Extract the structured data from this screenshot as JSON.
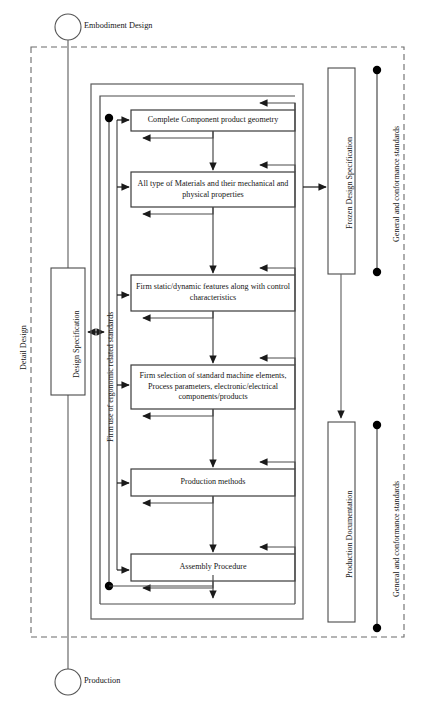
{
  "diagram": {
    "type": "flowchart",
    "phase_start_label": "Embodiment Design",
    "phase_end_label": "Production",
    "swimlane_label": "Detail Design",
    "colors": {
      "stroke": "#4a4a4a",
      "box_stroke": "#3a3a3a",
      "text": "#151515",
      "dashed_stroke": "#6b6b6b",
      "node_fill": "#000000",
      "background": "#ffffff"
    },
    "process_boxes": [
      {
        "id": "box-complete-component-product-geometry",
        "label": "Complete Component product geometry"
      },
      {
        "id": "box-all-type-of-materials",
        "label": "All type of Materials and their mechanical and physical properties"
      },
      {
        "id": "box-firm-static-dynamic-features",
        "label": "Firm static/dynamic features along with control characteristics"
      },
      {
        "id": "box-firm-selection-of-standard-machine-elements",
        "label": "Firm selection of standard machine elements, Process parameters, electronic/electrical components/products"
      },
      {
        "id": "box-production-methods",
        "label": "Production methods"
      },
      {
        "id": "box-assembly-procedure",
        "label": "Assembly Procedure"
      }
    ],
    "side_boxes": [
      {
        "id": "box-design-specification",
        "label": "Design Specification",
        "side": "left"
      },
      {
        "id": "box-frozen-design-specification",
        "label": "Frozen Design Specification",
        "side": "right"
      },
      {
        "id": "box-production-documentation",
        "label": "Production Documentation",
        "side": "right"
      }
    ],
    "standard_lines": [
      {
        "id": "label-ergonomic-standards",
        "label": "Firm use of ergonomic related standards",
        "side": "left"
      },
      {
        "id": "label-general-conformance-standards-upper",
        "label": "General and conformance standards",
        "side": "right"
      },
      {
        "id": "label-general-conformance-standards-lower",
        "label": "General and conformance standards",
        "side": "right"
      }
    ],
    "terminators": [
      {
        "id": "terminator-embodiment-design",
        "label": "Embodiment Design",
        "shape": "circle"
      },
      {
        "id": "terminator-production",
        "label": "Production",
        "shape": "circle"
      }
    ]
  }
}
